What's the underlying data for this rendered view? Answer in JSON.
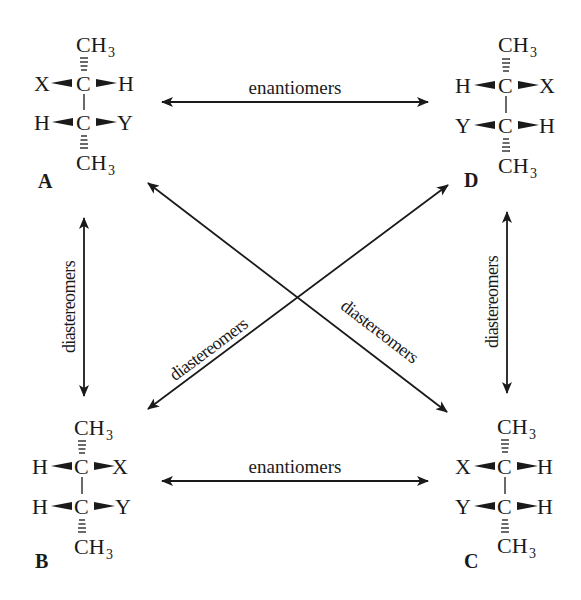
{
  "diagram": {
    "title": "",
    "colors": {
      "ink": "#1a1a1a",
      "background": "#ffffff"
    },
    "molecules": [
      {
        "id": "A",
        "label": "A",
        "top": "CH",
        "top_sub": "3",
        "bottom": "CH",
        "bottom_sub": "3",
        "row1": {
          "left": "X",
          "center": "C",
          "right": "H"
        },
        "row2": {
          "left": "H",
          "center": "C",
          "right": "Y"
        }
      },
      {
        "id": "D",
        "label": "D",
        "top": "CH",
        "top_sub": "3",
        "bottom": "CH",
        "bottom_sub": "3",
        "row1": {
          "left": "H",
          "center": "C",
          "right": "X"
        },
        "row2": {
          "left": "Y",
          "center": "C",
          "right": "H"
        }
      },
      {
        "id": "B",
        "label": "B",
        "top": "CH",
        "top_sub": "3",
        "bottom": "CH",
        "bottom_sub": "3",
        "row1": {
          "left": "H",
          "center": "C",
          "right": "X"
        },
        "row2": {
          "left": "H",
          "center": "C",
          "right": "Y"
        }
      },
      {
        "id": "C",
        "label": "C",
        "top": "CH",
        "top_sub": "3",
        "bottom": "CH",
        "bottom_sub": "3",
        "row1": {
          "left": "X",
          "center": "C",
          "right": "H"
        },
        "row2": {
          "left": "Y",
          "center": "C",
          "right": "H"
        }
      }
    ],
    "relations": [
      {
        "from": "A",
        "to": "D",
        "label": "enantiomers",
        "direction": "horizontal-top"
      },
      {
        "from": "B",
        "to": "C",
        "label": "enantiomers",
        "direction": "horizontal-bottom"
      },
      {
        "from": "A",
        "to": "B",
        "label": "diastereomers",
        "direction": "vertical-left"
      },
      {
        "from": "D",
        "to": "C",
        "label": "diastereomers",
        "direction": "vertical-right"
      },
      {
        "from": "D",
        "to": "B",
        "label": "diastereomers",
        "direction": "diagonal"
      },
      {
        "from": "A",
        "to": "C",
        "label": "diastereomers",
        "direction": "diagonal"
      }
    ]
  }
}
